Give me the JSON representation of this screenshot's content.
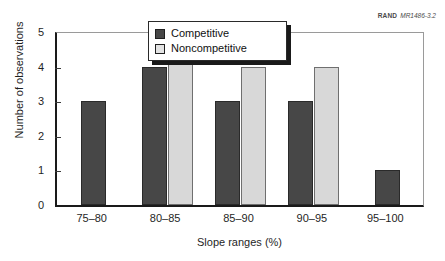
{
  "credit": {
    "mark": "RAND",
    "document": "MR1486-3.2"
  },
  "chart_data": {
    "type": "bar",
    "title": "",
    "xlabel": "Slope ranges (%)",
    "ylabel": "Number of observations",
    "categories": [
      "75–80",
      "80–85",
      "85–90",
      "90–95",
      "95–100"
    ],
    "series": [
      {
        "name": "Competitive",
        "color": "#474747",
        "values": [
          3,
          4,
          3,
          3,
          1
        ]
      },
      {
        "name": "Noncompetitive",
        "color": "#d8d8d8",
        "values": [
          0,
          5,
          4,
          4,
          0
        ]
      }
    ],
    "ylim": [
      0,
      5
    ],
    "yticks": [
      0,
      1,
      2,
      3,
      4,
      5
    ],
    "ytick_labels": [
      "0",
      "1",
      "2",
      "3",
      "4",
      "5"
    ],
    "grid": false,
    "legend_position": "top-center"
  }
}
